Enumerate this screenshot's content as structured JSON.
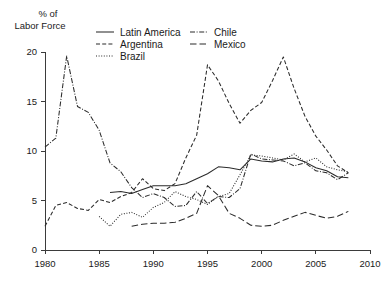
{
  "chart_data": {
    "type": "line",
    "title": "",
    "ylabel": "% of\nLabor Force",
    "ylabel_line1": "% of",
    "ylabel_line2": "Labor Force",
    "xlabel": "",
    "xlim": [
      1980,
      2010
    ],
    "ylim": [
      0,
      20
    ],
    "xticks": [
      1980,
      1985,
      1990,
      1995,
      2000,
      2005,
      2010
    ],
    "xtick_labels": [
      "1980",
      "1985",
      "1990",
      "1995",
      "2000",
      "2005",
      "2010"
    ],
    "yticks": [
      0,
      5,
      10,
      15,
      20
    ],
    "ytick_labels": [
      "0",
      "5",
      "10",
      "15",
      "20"
    ],
    "grid": false,
    "legend_position": "top-center",
    "legend": [
      {
        "label": "Latin America",
        "style": "solid"
      },
      {
        "label": "Argentina",
        "style": "dashed"
      },
      {
        "label": "Brazil",
        "style": "dotted"
      },
      {
        "label": "Chile",
        "style": "dashdot"
      },
      {
        "label": "Mexico",
        "style": "longdash"
      }
    ],
    "series": [
      {
        "name": "Latin America",
        "style": "solid",
        "dasharray": "none",
        "x": [
          1986,
          1987,
          1988,
          1989,
          1990,
          1991,
          1992,
          1993,
          1994,
          1995,
          1996,
          1997,
          1998,
          1999,
          2000,
          2001,
          2002,
          2003,
          2004,
          2005,
          2006,
          2007,
          2008
        ],
        "values": [
          5.8,
          5.9,
          5.7,
          6.1,
          6.5,
          6.5,
          6.5,
          6.7,
          7.2,
          7.7,
          8.4,
          8.3,
          8.1,
          9.2,
          9.0,
          8.9,
          9.2,
          9.3,
          8.9,
          8.3,
          8.0,
          7.4,
          7.3
        ]
      },
      {
        "name": "Argentina",
        "style": "dashed",
        "dasharray": "4,2.2",
        "x": [
          1980,
          1981,
          1982,
          1983,
          1984,
          1985,
          1986,
          1987,
          1988,
          1989,
          1990,
          1991,
          1992,
          1993,
          1994,
          1995,
          1996,
          1997,
          1998,
          1999,
          2000,
          2001,
          2002,
          2003,
          2004,
          2005,
          2006,
          2007,
          2008
        ],
        "values": [
          2.4,
          4.5,
          4.8,
          4.2,
          4.0,
          5.1,
          4.8,
          5.4,
          5.8,
          7.2,
          6.2,
          6.0,
          6.7,
          9.3,
          11.6,
          18.7,
          17.1,
          14.8,
          12.8,
          14.1,
          14.9,
          17.1,
          19.5,
          16.3,
          13.5,
          11.5,
          10.1,
          8.5,
          7.8
        ]
      },
      {
        "name": "Brazil",
        "style": "dotted",
        "dasharray": "1,1.6",
        "x": [
          1985,
          1986,
          1987,
          1988,
          1989,
          1990,
          1991,
          1992,
          1993,
          1994,
          1995,
          1996,
          1997,
          1998,
          1999,
          2000,
          2001,
          2002,
          2003,
          2004,
          2005,
          2006,
          2007,
          2008
        ],
        "values": [
          3.4,
          2.4,
          3.6,
          3.8,
          3.3,
          4.3,
          4.8,
          5.9,
          5.4,
          5.1,
          4.6,
          5.4,
          5.7,
          7.6,
          9.6,
          9.5,
          9.3,
          9.1,
          9.7,
          8.9,
          9.3,
          8.4,
          8.1,
          7.9
        ]
      },
      {
        "name": "Chile",
        "style": "dashdot",
        "dasharray": "5,1.6,1,1.6",
        "x": [
          1980,
          1981,
          1982,
          1983,
          1984,
          1985,
          1986,
          1987,
          1988,
          1989,
          1990,
          1991,
          1992,
          1993,
          1994,
          1995,
          1996,
          1997,
          1998,
          1999,
          2000,
          2001,
          2002,
          2003,
          2004,
          2005,
          2006,
          2007,
          2008
        ],
        "values": [
          10.4,
          11.3,
          19.6,
          14.5,
          13.9,
          12.1,
          8.8,
          7.9,
          6.3,
          5.3,
          5.7,
          5.3,
          4.4,
          4.5,
          5.9,
          4.7,
          5.4,
          5.3,
          6.2,
          9.7,
          9.2,
          9.1,
          9.0,
          8.5,
          8.8,
          8.0,
          7.8,
          7.1,
          7.8
        ]
      },
      {
        "name": "Mexico",
        "style": "longdash",
        "dasharray": "6.5,3",
        "x": [
          1988,
          1989,
          1990,
          1991,
          1992,
          1993,
          1994,
          1995,
          1996,
          1997,
          1998,
          1999,
          2000,
          2001,
          2002,
          2003,
          2004,
          2005,
          2006,
          2007,
          2008
        ],
        "values": [
          2.4,
          2.6,
          2.7,
          2.7,
          2.8,
          3.2,
          3.7,
          6.5,
          5.5,
          3.7,
          3.2,
          2.5,
          2.4,
          2.5,
          3.0,
          3.4,
          3.8,
          3.5,
          3.2,
          3.4,
          3.9
        ]
      }
    ]
  },
  "axes": {
    "y_title_line1": "% of",
    "y_title_line2": "Labor Force"
  }
}
